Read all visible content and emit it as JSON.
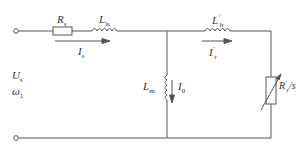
{
  "diagram": {
    "stroke_color": "#555555",
    "terminals": [
      {
        "id": "input-top",
        "x": 16,
        "y": 31
      },
      {
        "id": "input-bottom",
        "x": 16,
        "y": 138
      }
    ],
    "components": [
      {
        "id": "Rs",
        "type": "resistor",
        "label": {
          "main": "R",
          "sub": "s"
        }
      },
      {
        "id": "Lls",
        "type": "inductor",
        "label": {
          "main": "L",
          "sub": "ls"
        }
      },
      {
        "id": "Lm",
        "type": "inductor",
        "label": {
          "main": "L",
          "sub": "m"
        }
      },
      {
        "id": "Llr",
        "type": "inductor",
        "label": {
          "main": "L",
          "sub": "lr",
          "prime": "′"
        }
      },
      {
        "id": "Rr_s",
        "type": "variable-resistor",
        "label": {
          "main": "R",
          "sub": "r",
          "prime": "′",
          "suffix": "/s"
        }
      }
    ],
    "currents": [
      {
        "id": "Is",
        "label": {
          "main": "I",
          "sub": "s"
        },
        "direction": "right"
      },
      {
        "id": "I0",
        "label": {
          "main": "I",
          "sub": "0"
        },
        "direction": "down"
      },
      {
        "id": "Ir",
        "label": {
          "main": "I",
          "sub": "r",
          "prime": "′"
        },
        "direction": "right"
      }
    ],
    "source": {
      "voltage": {
        "main": "U",
        "sub": "s"
      },
      "frequency": {
        "main": "ω",
        "sub": "1"
      }
    }
  }
}
